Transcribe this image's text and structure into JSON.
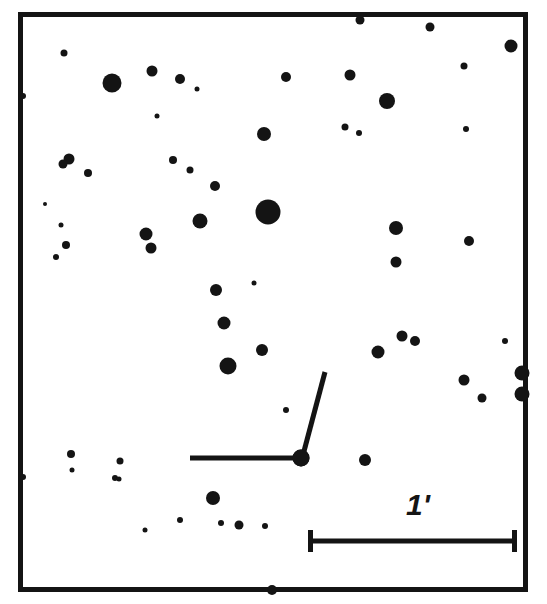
{
  "figure": {
    "kind": "astronomical-finder-chart",
    "width": 547,
    "height": 604,
    "background_color": "#ffffff",
    "ink_color": "#141414"
  },
  "frame": {
    "name": "chart-border",
    "x": 18,
    "y": 12,
    "width": 510,
    "height": 580,
    "stroke_width": 5,
    "color": "#141414"
  },
  "scale_bar": {
    "label": "1'",
    "label_x": 418,
    "label_y": 515,
    "label_font_size": 30,
    "y": 541,
    "x_start": 308,
    "x_end": 517,
    "cap_half_height": 11,
    "stroke_width": 5,
    "color": "#141414"
  },
  "target_marker": {
    "name": "target-pointer-lines",
    "color": "#141414",
    "stroke_width": 5,
    "horizontal_line": {
      "x1": 190,
      "y1": 458,
      "x2": 299,
      "y2": 458
    },
    "diagonal_line": {
      "x1": 325,
      "y1": 372,
      "x2": 303,
      "y2": 455
    },
    "target_star": {
      "cx": 301,
      "cy": 458,
      "r": 8.5
    }
  },
  "chart_data": {
    "type": "scatter",
    "title": "",
    "xlabel": "",
    "ylabel": "",
    "grid": false,
    "legend": null,
    "axis_note": "sky image, pixel coordinates; radius encodes apparent brightness",
    "xlim": [
      18,
      528
    ],
    "ylim": [
      12,
      592
    ],
    "scale_reference": {
      "length_px": 209,
      "angular_size": "1'"
    },
    "stars": [
      {
        "cx": 112,
        "cy": 83,
        "r": 9.5
      },
      {
        "cx": 268,
        "cy": 212,
        "r": 12.5
      },
      {
        "cx": 387,
        "cy": 101,
        "r": 8.0
      },
      {
        "cx": 200,
        "cy": 221,
        "r": 7.5
      },
      {
        "cx": 146,
        "cy": 234,
        "r": 6.5
      },
      {
        "cx": 264,
        "cy": 134,
        "r": 7.0
      },
      {
        "cx": 228,
        "cy": 366,
        "r": 8.5
      },
      {
        "cx": 224,
        "cy": 323,
        "r": 6.5
      },
      {
        "cx": 262,
        "cy": 350,
        "r": 6.0
      },
      {
        "cx": 216,
        "cy": 290,
        "r": 6.0
      },
      {
        "cx": 180,
        "cy": 79,
        "r": 5.0
      },
      {
        "cx": 215,
        "cy": 186,
        "r": 5.0
      },
      {
        "cx": 396,
        "cy": 228,
        "r": 7.0
      },
      {
        "cx": 396,
        "cy": 262,
        "r": 5.5
      },
      {
        "cx": 469,
        "cy": 241,
        "r": 5.0
      },
      {
        "cx": 378,
        "cy": 352,
        "r": 6.5
      },
      {
        "cx": 402,
        "cy": 336,
        "r": 5.5
      },
      {
        "cx": 415,
        "cy": 341,
        "r": 5.0
      },
      {
        "cx": 464,
        "cy": 380,
        "r": 5.5
      },
      {
        "cx": 505,
        "cy": 341,
        "r": 3.0
      },
      {
        "cx": 522,
        "cy": 373,
        "r": 7.5
      },
      {
        "cx": 522,
        "cy": 394,
        "r": 7.5
      },
      {
        "cx": 482,
        "cy": 398,
        "r": 4.5
      },
      {
        "cx": 466,
        "cy": 129,
        "r": 3.0
      },
      {
        "cx": 464,
        "cy": 66,
        "r": 3.5
      },
      {
        "cx": 350,
        "cy": 75,
        "r": 5.5
      },
      {
        "cx": 345,
        "cy": 127,
        "r": 3.5
      },
      {
        "cx": 360,
        "cy": 20,
        "r": 4.5
      },
      {
        "cx": 430,
        "cy": 27,
        "r": 4.5
      },
      {
        "cx": 511,
        "cy": 46,
        "r": 6.5
      },
      {
        "cx": 359,
        "cy": 133,
        "r": 3.0
      },
      {
        "cx": 286,
        "cy": 77,
        "r": 5.0
      },
      {
        "cx": 152,
        "cy": 71,
        "r": 5.5
      },
      {
        "cx": 69,
        "cy": 159,
        "r": 5.5
      },
      {
        "cx": 63,
        "cy": 164,
        "r": 4.5
      },
      {
        "cx": 88,
        "cy": 173,
        "r": 4.0
      },
      {
        "cx": 61,
        "cy": 225,
        "r": 2.5
      },
      {
        "cx": 66,
        "cy": 245,
        "r": 4.0
      },
      {
        "cx": 56,
        "cy": 257,
        "r": 3.0
      },
      {
        "cx": 173,
        "cy": 160,
        "r": 4.0
      },
      {
        "cx": 190,
        "cy": 170,
        "r": 3.5
      },
      {
        "cx": 151,
        "cy": 248,
        "r": 5.5
      },
      {
        "cx": 23,
        "cy": 96,
        "r": 3.0
      },
      {
        "cx": 23,
        "cy": 477,
        "r": 3.0
      },
      {
        "cx": 64,
        "cy": 53,
        "r": 3.5
      },
      {
        "cx": 71,
        "cy": 454,
        "r": 4.0
      },
      {
        "cx": 120,
        "cy": 461,
        "r": 3.5
      },
      {
        "cx": 72,
        "cy": 470,
        "r": 2.5
      },
      {
        "cx": 115,
        "cy": 478,
        "r": 3.0
      },
      {
        "cx": 119,
        "cy": 479,
        "r": 2.5
      },
      {
        "cx": 213,
        "cy": 498,
        "r": 7.0
      },
      {
        "cx": 180,
        "cy": 520,
        "r": 3.0
      },
      {
        "cx": 239,
        "cy": 525,
        "r": 4.5
      },
      {
        "cx": 221,
        "cy": 523,
        "r": 3.0
      },
      {
        "cx": 265,
        "cy": 526,
        "r": 3.0
      },
      {
        "cx": 145,
        "cy": 530,
        "r": 2.5
      },
      {
        "cx": 365,
        "cy": 460,
        "r": 6.0
      },
      {
        "cx": 286,
        "cy": 410,
        "r": 3.0
      },
      {
        "cx": 272,
        "cy": 590,
        "r": 5.0
      },
      {
        "cx": 157,
        "cy": 116,
        "r": 2.5
      },
      {
        "cx": 254,
        "cy": 283,
        "r": 2.5
      },
      {
        "cx": 45,
        "cy": 204,
        "r": 2.0
      },
      {
        "cx": 197,
        "cy": 89,
        "r": 2.5
      },
      {
        "cx": 301,
        "cy": 458,
        "r": 8.5
      }
    ]
  }
}
